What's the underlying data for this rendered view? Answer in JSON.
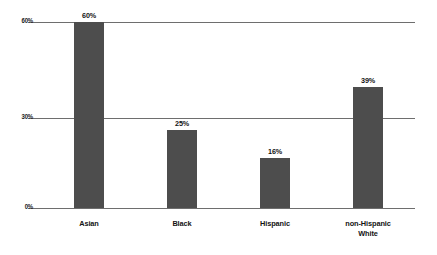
{
  "chart_data": {
    "type": "bar",
    "title": "",
    "subtitle": "",
    "xlabel": "",
    "ylabel": "",
    "categories": [
      "Asian",
      "Black",
      "Hispanic",
      "non-Hispanic White"
    ],
    "category_lines": [
      [
        "Asian"
      ],
      [
        "Black"
      ],
      [
        "Hispanic"
      ],
      [
        "non-Hispanic",
        "White"
      ]
    ],
    "values": [
      60,
      25,
      16,
      39
    ],
    "value_labels": [
      "60%",
      "25%",
      "16%",
      "39%"
    ],
    "ylim": [
      0,
      60
    ],
    "yticks": [
      0,
      30,
      60
    ],
    "ytick_labels": [
      "0%",
      "30%",
      "60%"
    ],
    "grid": true,
    "legend": false,
    "bar_color": "#4d4d4d",
    "gridline_color": "#6e6e6e",
    "background_color": "#ffffff",
    "text_color": "#131313"
  },
  "axis": {
    "y": {
      "tick_60": "60%",
      "tick_30": "30%",
      "tick_0": "0%"
    }
  },
  "bars": [
    {
      "label": "Asian",
      "value_label": "60%"
    },
    {
      "label": "Black",
      "value_label": "25%"
    },
    {
      "label": "Hispanic",
      "value_label": "16%"
    },
    {
      "label_line1": "non-Hispanic",
      "label_line2": "White",
      "value_label": "39%"
    }
  ]
}
